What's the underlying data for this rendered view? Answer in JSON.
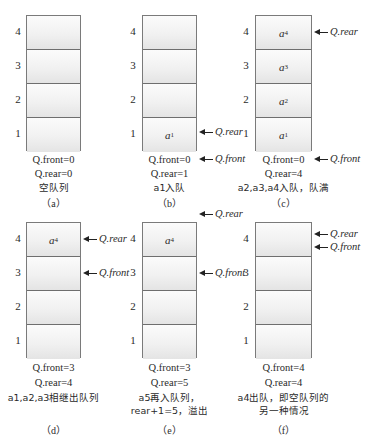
{
  "figure": {
    "row_indices": [
      "4",
      "3",
      "2",
      "1"
    ],
    "pointer_labels": {
      "rear": "Q.rear",
      "front": "Q.front"
    },
    "colors": {
      "border": "#7a7a7a",
      "cell_top": "#fbfbfb",
      "cell_bottom": "#e4e4e4",
      "text": "#2a2a2a"
    },
    "panels": [
      {
        "id": "a",
        "cells": [
          "",
          "",
          "",
          ""
        ],
        "front_text": "Q.front=0",
        "rear_text": "Q.rear=0",
        "desc": [
          "空队列"
        ],
        "caption": "（a）"
      },
      {
        "id": "b",
        "cells": [
          "",
          "",
          "",
          "a1"
        ],
        "front_text": "Q.front=0",
        "rear_text": "Q.rear=1",
        "desc": [
          "a1入队"
        ],
        "caption": "（b）",
        "rear_pointer_at": "cell 1",
        "front_pointer_at": "below box (0)"
      },
      {
        "id": "c",
        "cells": [
          "a4",
          "a3",
          "a2",
          "a1"
        ],
        "front_text": "Q.front=0",
        "rear_text": "Q.rear=4",
        "desc": [
          "a2,a3,a4入队，队满"
        ],
        "caption": "（c）",
        "rear_pointer_at": "cell 4",
        "front_pointer_at": "below box (0)"
      },
      {
        "id": "d",
        "cells": [
          "a4",
          "",
          "",
          ""
        ],
        "front_text": "Q.front=3",
        "rear_text": "Q.rear=4",
        "desc": [
          "a1,a2,a3相继出队列"
        ],
        "caption": "（d）",
        "rear_pointer_at": "cell 4",
        "front_pointer_at": "cell 3"
      },
      {
        "id": "e",
        "cells": [
          "a4",
          "",
          "",
          ""
        ],
        "front_text": "Q.front=3",
        "rear_text": "Q.rear=5",
        "desc": [
          "a5再入队列，",
          "rear+1=5，溢出"
        ],
        "caption": "（e）",
        "rear_pointer_at": "above box (5)",
        "front_pointer_at": "cell 3"
      },
      {
        "id": "f",
        "cells": [
          "",
          "",
          "",
          ""
        ],
        "front_text": "Q.front=4",
        "rear_text": "Q.rear=4",
        "desc": [
          "a4出队，即空队列的",
          "另一种情况"
        ],
        "caption": "（f）",
        "rear_pointer_at": "cell 4 (upper)",
        "front_pointer_at": "cell 4 (lower)"
      }
    ]
  }
}
